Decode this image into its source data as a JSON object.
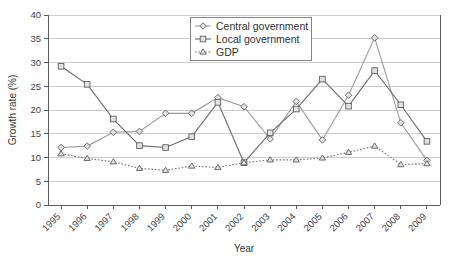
{
  "chart_data": {
    "type": "line",
    "title": "",
    "xlabel": "Year",
    "ylabel": "Growth rate (%)",
    "categories": [
      "1995",
      "1996",
      "1997",
      "1998",
      "1999",
      "2000",
      "2001",
      "2002",
      "2003",
      "2004",
      "2005",
      "2006",
      "2007",
      "2008",
      "2009"
    ],
    "ylim": [
      0,
      40
    ],
    "yticks": [
      0,
      5,
      10,
      15,
      20,
      25,
      30,
      35,
      40
    ],
    "ytick_labels": [
      "0",
      "5",
      "10",
      "15",
      "20",
      "25",
      "30",
      "35",
      "40"
    ],
    "grid": true,
    "legend_position": "top-center",
    "series": [
      {
        "name": "Central government",
        "marker": "diamond",
        "linestyle": "solid",
        "color": "#9b9b9b",
        "values": [
          12.1,
          12.4,
          15.3,
          15.5,
          19.3,
          19.3,
          22.6,
          20.7,
          13.9,
          21.8,
          13.7,
          23.1,
          35.2,
          17.3,
          9.4
        ]
      },
      {
        "name": "Local government",
        "marker": "square",
        "linestyle": "solid",
        "color": "#6b6b6b",
        "values": [
          29.2,
          25.4,
          18.1,
          12.5,
          12.1,
          14.4,
          21.6,
          8.9,
          15.2,
          20.2,
          26.5,
          20.8,
          28.3,
          21.1,
          13.4
        ]
      },
      {
        "name": "GDP",
        "marker": "triangle",
        "linestyle": "dotted",
        "color": "#6f6f6f",
        "values": [
          10.8,
          9.8,
          9.1,
          7.7,
          7.3,
          8.2,
          7.9,
          8.9,
          9.5,
          9.5,
          9.9,
          11.1,
          12.4,
          8.5,
          8.7
        ]
      }
    ]
  },
  "legend": {
    "items": [
      {
        "label": "Central government"
      },
      {
        "label": "Local government"
      },
      {
        "label": "GDP"
      }
    ]
  },
  "axes": {
    "y_title": "Growth rate (%)",
    "x_title": "Year"
  }
}
